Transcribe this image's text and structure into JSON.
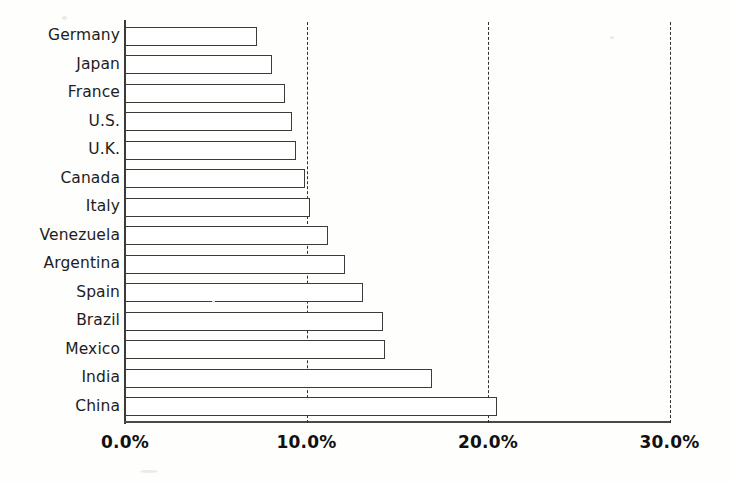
{
  "chart_data": {
    "type": "bar",
    "orientation": "horizontal",
    "title": "",
    "subtitle": "",
    "xlabel": "",
    "ylabel": "",
    "xlim": [
      0,
      30
    ],
    "ylim": null,
    "grid": true,
    "grid_axis": "x",
    "grid_style": "dashed",
    "legend": null,
    "legend_position": "none",
    "categories": [
      "Germany",
      "Japan",
      "France",
      "U.S.",
      "U.K.",
      "Canada",
      "Italy",
      "Venezuela",
      "Argentina",
      "Spain",
      "Brazil",
      "Mexico",
      "India",
      "China"
    ],
    "values": [
      7.3,
      8.1,
      8.8,
      9.2,
      9.4,
      9.9,
      10.2,
      11.2,
      12.1,
      13.1,
      14.2,
      14.3,
      16.9,
      20.5
    ],
    "value_unit": "%",
    "xticks": [
      0,
      10,
      20,
      30
    ],
    "xtick_labels": [
      "0.0%",
      "10.0%",
      "20.0%",
      "30.0%"
    ],
    "bar_fill_color": "#ffffff",
    "bar_border_color": "#3b3b3b",
    "axis_color": "#3a3a3a",
    "gridline_color": "#2f2f2f",
    "background_color": "#fefefd",
    "text_color": "#1d1d1d"
  }
}
